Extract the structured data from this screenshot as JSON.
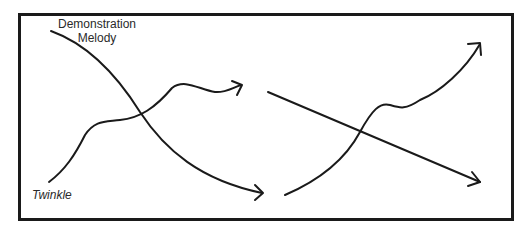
{
  "diagram": {
    "left_panel": {
      "labels": {
        "demonstration_line1": "Demonstration",
        "demonstration_line2": "Melody",
        "twinkle": "Twinkle"
      },
      "curves": [
        {
          "name": "Demonstration Melody",
          "direction": "descending"
        },
        {
          "name": "Twinkle",
          "direction": "ascending"
        }
      ]
    },
    "right_panel": {
      "curves": [
        {
          "name": "straight-line",
          "direction": "descending"
        },
        {
          "name": "wavy-curve",
          "direction": "ascending"
        }
      ]
    },
    "colors": {
      "stroke": "#1a1a1a",
      "background": "#ffffff"
    }
  }
}
